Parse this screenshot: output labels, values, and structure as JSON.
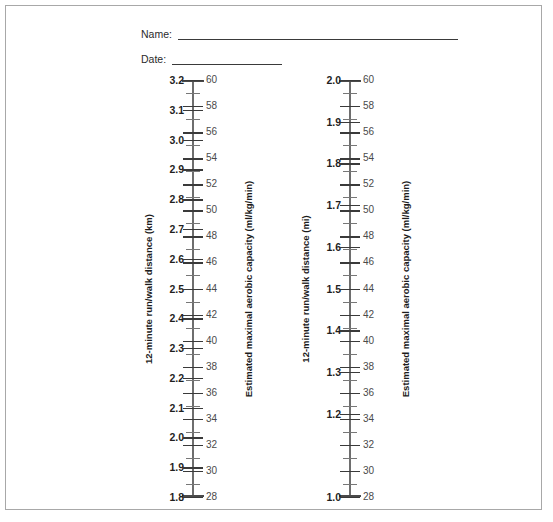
{
  "form": {
    "name_label": "Name:",
    "date_label": "Date:",
    "name_value": "",
    "date_value": ""
  },
  "colors": {
    "border": "#a8a8a8",
    "spine": "#6e6e6e",
    "major_tick": "#3a3a3a",
    "minor_tick": "#777777",
    "text": "#2e2e2e"
  },
  "chart_data": [
    {
      "type": "nomogram",
      "id": "left",
      "title": "",
      "left_axis_label": "12-minute run/walk distance (km)",
      "right_axis_label": "Estimated maximal aerobic capacity (ml/kg/min)",
      "left_axis_unit": "km",
      "right_axis_unit": "ml/kg/min",
      "left_range": [
        1.8,
        3.2
      ],
      "right_range": [
        28,
        60
      ],
      "left_ticks": [
        3.2,
        3.1,
        3.0,
        2.9,
        2.8,
        2.7,
        2.6,
        2.5,
        2.4,
        2.3,
        2.2,
        2.1,
        2.0,
        1.9,
        1.8
      ],
      "left_tick_labels": [
        "3.2",
        "3.1",
        "3.0",
        "2.9",
        "2.8",
        "2.7",
        "2.6",
        "2.5",
        "2.4",
        "2.3",
        "2.2",
        "2.1",
        "2.0",
        "1.9",
        "1.8"
      ],
      "right_ticks": [
        60,
        58,
        56,
        54,
        52,
        50,
        48,
        46,
        44,
        42,
        40,
        38,
        36,
        34,
        32,
        30,
        28
      ],
      "right_tick_labels": [
        "60",
        "58",
        "56",
        "54",
        "52",
        "50",
        "48",
        "46",
        "44",
        "42",
        "40",
        "38",
        "36",
        "34",
        "32",
        "30",
        "28"
      ],
      "right_minor_step": 1,
      "grid": false,
      "legend": null
    },
    {
      "type": "nomogram",
      "id": "right",
      "title": "",
      "left_axis_label": "12-minute run/walk distance (mi)",
      "right_axis_label": "Estimated maximal aerobic capacity (ml/kg/min)",
      "left_axis_unit": "mi",
      "right_axis_unit": "ml/kg/min",
      "left_range": [
        1.0,
        2.0
      ],
      "right_range": [
        28,
        60
      ],
      "left_ticks": [
        2.0,
        1.9,
        1.8,
        1.7,
        1.6,
        1.5,
        1.4,
        1.3,
        1.2,
        1.1,
        1.0
      ],
      "left_tick_labels": [
        "2.0",
        "1.9",
        "1.8",
        "1.7",
        "1.6",
        "1.5",
        "1.4",
        "1.3",
        "1.2",
        "",
        "1.0"
      ],
      "right_ticks": [
        60,
        58,
        56,
        54,
        52,
        50,
        48,
        46,
        44,
        42,
        40,
        38,
        36,
        34,
        32,
        30,
        28
      ],
      "right_tick_labels": [
        "60",
        "58",
        "56",
        "54",
        "52",
        "50",
        "48",
        "46",
        "44",
        "42",
        "40",
        "38",
        "36",
        "34",
        "32",
        "30",
        "28"
      ],
      "right_minor_step": 1,
      "grid": false,
      "legend": null
    }
  ]
}
